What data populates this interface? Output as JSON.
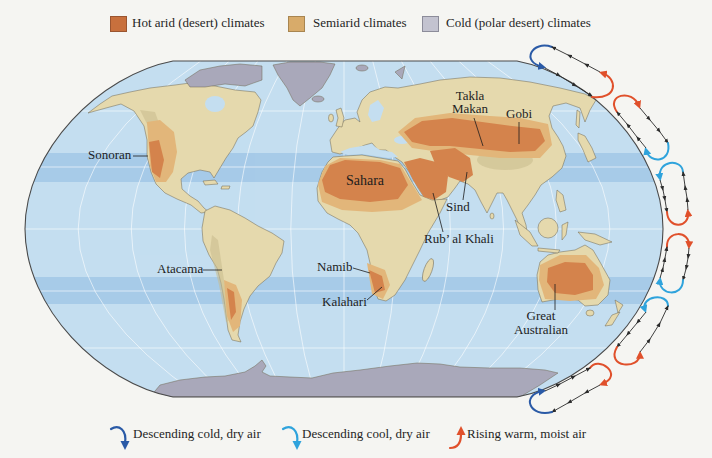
{
  "legend_top": {
    "items": [
      {
        "label": "Hot arid (desert) climates",
        "swatch_color": "#c8703d",
        "swatch_border": "#9a5530"
      },
      {
        "label": "Semiarid climates",
        "swatch_color": "#d8ab6a",
        "swatch_border": "#a88550"
      },
      {
        "label": "Cold (polar desert) climates",
        "swatch_color": "#c3c3d0",
        "swatch_border": "#8c8c9a"
      }
    ]
  },
  "legend_bottom": {
    "items": [
      {
        "label": "Descending cold, dry air",
        "arrow_color": "#2a5aa6",
        "icon": "descending-arrow-icon"
      },
      {
        "label": "Descending cool, dry air",
        "arrow_color": "#2fa3dc",
        "icon": "descending-arrow-icon"
      },
      {
        "label": "Rising warm, moist air",
        "arrow_color": "#e0502b",
        "icon": "rising-arrow-icon"
      }
    ]
  },
  "map": {
    "colors": {
      "ocean": "#c4def0",
      "tropic_band": "#a7cbe8",
      "land": "#e5d9ad",
      "highland": "#c9bb8c",
      "semiarid": "#e2b67a",
      "hot_arid": "#d4834c",
      "polar": "#a9a8ba",
      "outline": "#4a4a4a"
    },
    "desert_labels": {
      "sonoran": "Sonoran",
      "takla_makan": [
        "Takla",
        "Makan"
      ],
      "gobi": "Gobi",
      "sahara": "Sahara",
      "sind": "Sind",
      "rub_al_khali": "Rub’ al Khali",
      "atacama": "Atacama",
      "namib": "Namib",
      "kalahari": "Kalahari",
      "great_australian": [
        "Great",
        "Australian"
      ]
    }
  },
  "circulation": {
    "flow_line_color": "#2b2b2b",
    "rising_warm_color": "#e0502b",
    "descending_cold_color": "#2a5aa6",
    "descending_cool_color": "#2fa3dc"
  }
}
